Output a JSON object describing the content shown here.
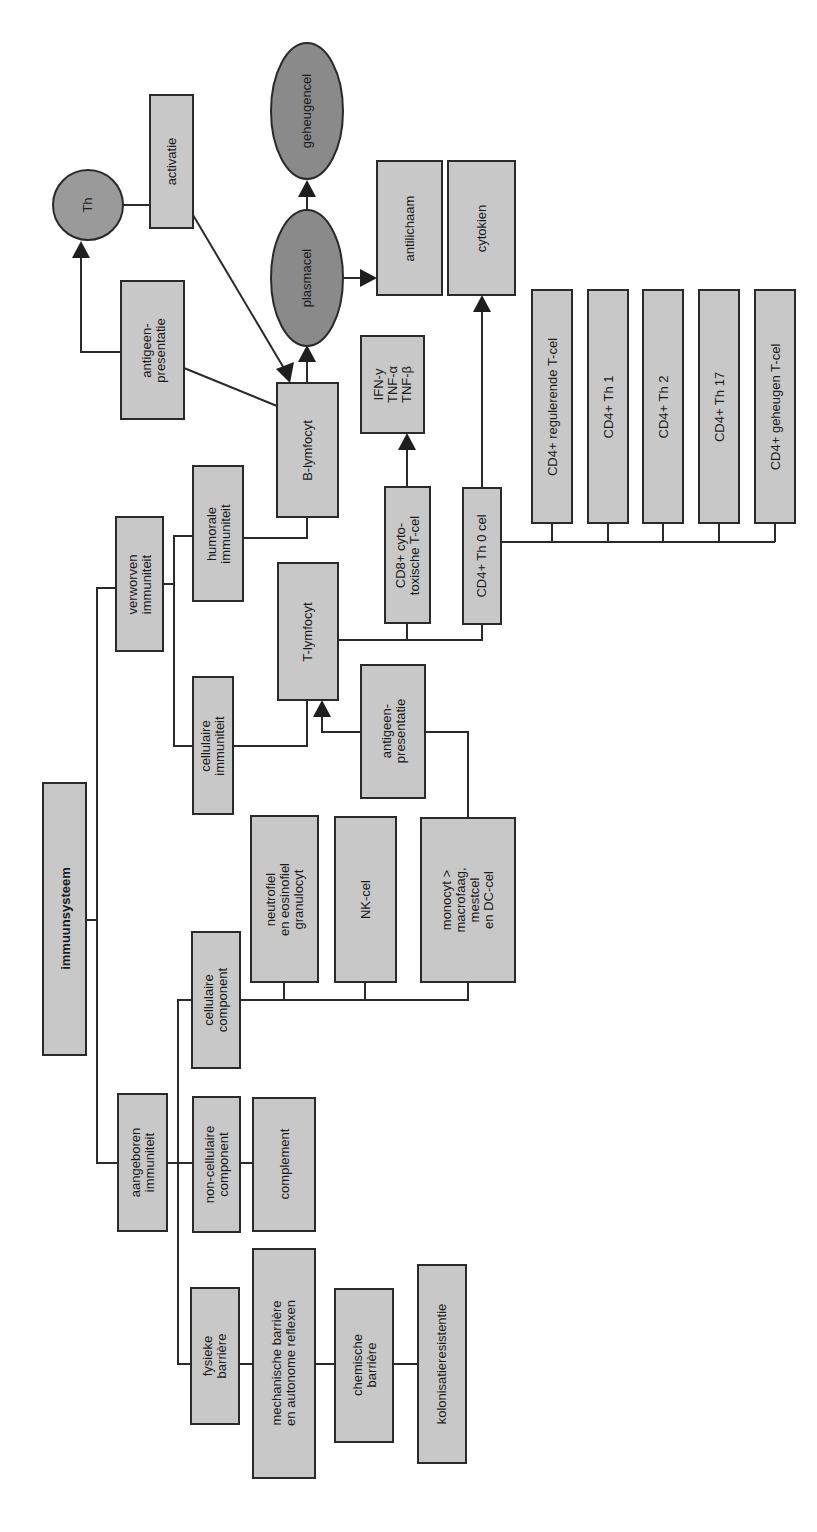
{
  "diagram": {
    "title": "immuunsysteem",
    "nodes": {
      "root": "immuunsysteem",
      "aangeboren": "aangeboren\nimmuniteit",
      "verworven": "verworven\nimmuniteit",
      "fysieke": "fysieke\nbarrière",
      "mechanische": "mechanische barrière\nen autonome reflexen",
      "chemische": "chemische\nbarrière",
      "kolonisatie": "kolonisatieresistentie",
      "noncellulaire": "non-cellulaire\ncomponent",
      "complement": "complement",
      "cellulairecomp": "cellulaire\ncomponent",
      "neutrofiel": "neutrofiel\nen eosinofiel\ngranulocyt",
      "nkcel": "NK-cel",
      "monocyt": "monocyt >\nmacrofaag,\nmestcel\nen DC-cel",
      "cellulaireimm": "cellulaire\nimmuniteit",
      "humorale": "humorale\nimmuniteit",
      "tlymfocyt": "T-lymfocyt",
      "antigeen_t": "antigeen-\npresentatie",
      "blymfocyt": "B-lymfocyt",
      "antigeen_b": "antigeen-\npresentatie",
      "th": "Th",
      "activatie": "activatie",
      "plasmacel": "plasmacel",
      "geheugencel": "geheugencel",
      "antilichaam": "antilichaam",
      "cytokien": "cytokien",
      "cd8": "CD8+ cyto-\ntoxische T-cel",
      "ifn": "IFN-y\nTNF-α\nTNF-β",
      "cd4th0": "CD4+ Th 0 cel",
      "cd4reg": "CD4+ regulerende T-cel",
      "cd4th1": "CD4+ Th 1",
      "cd4th2": "CD4+ Th 2",
      "cd4th17": "CD4+ Th 17",
      "cd4geh": "CD4+ geheugen T-cel"
    },
    "colors": {
      "box_fill": "#c8c8c8",
      "oval_fill": "#8a8a8a",
      "stroke": "#2a2a2a"
    }
  }
}
